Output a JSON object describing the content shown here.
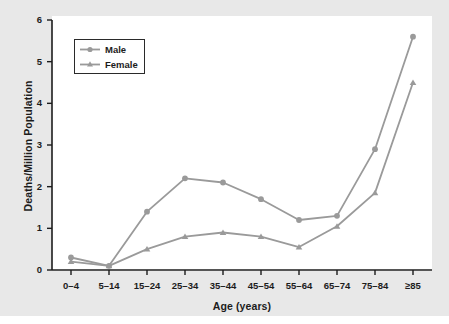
{
  "figure": {
    "background_color": "#e8e8e8",
    "panel_color": "#ffffff",
    "series_color": "#9a9a9a",
    "axis_color": "#1c1c1c"
  },
  "chart_data": {
    "type": "line",
    "title": "",
    "subtitle": "",
    "xlabel": "Age (years)",
    "ylabel": "Deaths/Million Population",
    "categories": [
      "0–4",
      "5–14",
      "15–24",
      "25–34",
      "35–44",
      "45–54",
      "55–64",
      "65–74",
      "75–84",
      "≥85"
    ],
    "series": [
      {
        "name": "Male",
        "marker": "circle",
        "color": "#9a9a9a",
        "values": [
          0.3,
          0.1,
          1.4,
          2.2,
          2.1,
          1.7,
          1.2,
          1.3,
          2.9,
          5.6
        ]
      },
      {
        "name": "Female",
        "marker": "triangle",
        "color": "#9a9a9a",
        "values": [
          0.2,
          0.1,
          0.5,
          0.8,
          0.9,
          0.8,
          0.55,
          1.05,
          1.85,
          4.5
        ]
      }
    ],
    "ylim": [
      0,
      6
    ],
    "yticks": [
      0,
      1,
      2,
      3,
      4,
      5,
      6
    ],
    "ytick_labels": [
      "0",
      "1",
      "2",
      "3",
      "4",
      "5",
      "6"
    ],
    "grid": false,
    "legend_position": "upper left"
  },
  "legend": {
    "entries": [
      {
        "label": "Male",
        "marker": "circle"
      },
      {
        "label": "Female",
        "marker": "triangle"
      }
    ]
  }
}
